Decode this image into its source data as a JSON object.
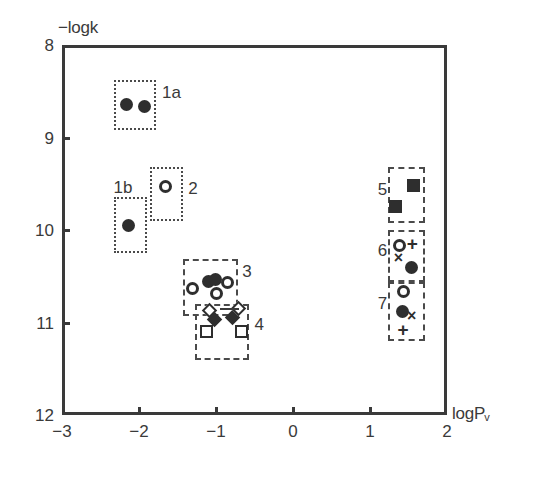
{
  "chart_data": {
    "type": "scatter",
    "title": "",
    "xlabel": "logPv",
    "ylabel": "-logk",
    "xlim": [
      -3,
      2
    ],
    "ylim": [
      12,
      8
    ],
    "y_axis_inverted": true,
    "grid": false,
    "legend": "none",
    "xticks": [
      -3,
      -2,
      -1,
      0,
      1,
      2
    ],
    "xtick_labels": [
      "-3",
      "-2",
      "-1",
      "0",
      "1",
      "2"
    ],
    "yticks": [
      8,
      9,
      10,
      11,
      12
    ],
    "ytick_labels": [
      "8",
      "9",
      "10",
      "11",
      "12"
    ],
    "groups": [
      {
        "name": "1a",
        "label": "1a",
        "box": {
          "x": [
            -2.32,
            -1.78
          ],
          "y": [
            8.38,
            8.92
          ],
          "style": "dotted"
        },
        "label_pos": {
          "x": -1.7,
          "y": 8.52
        },
        "points": [
          {
            "x": -2.16,
            "y": 8.64,
            "marker": "filled-circle"
          },
          {
            "x": -1.93,
            "y": 8.66,
            "marker": "filled-circle"
          }
        ]
      },
      {
        "name": "1b",
        "label": "1b",
        "box": {
          "x": [
            -2.33,
            -1.9
          ],
          "y": [
            9.64,
            10.25
          ],
          "style": "dotted"
        },
        "label_pos": {
          "x": -2.33,
          "y": 9.55
        },
        "points": [
          {
            "x": -2.13,
            "y": 9.95,
            "marker": "filled-circle"
          }
        ]
      },
      {
        "name": "2",
        "label": "2",
        "box": {
          "x": [
            -1.86,
            -1.43
          ],
          "y": [
            9.32,
            9.9
          ],
          "style": "dotted"
        },
        "label_pos": {
          "x": -1.36,
          "y": 9.56
        },
        "points": [
          {
            "x": -1.66,
            "y": 9.53,
            "marker": "open-circle"
          }
        ]
      },
      {
        "name": "3",
        "label": "3",
        "box": {
          "x": [
            -1.43,
            -0.72
          ],
          "y": [
            10.31,
            10.93
          ],
          "style": "dashed"
        },
        "label_pos": {
          "x": -0.66,
          "y": 10.45
        },
        "points": [
          {
            "x": -1.3,
            "y": 10.63,
            "marker": "open-circle"
          },
          {
            "x": -1.1,
            "y": 10.56,
            "marker": "filled-circle"
          },
          {
            "x": -1.01,
            "y": 10.54,
            "marker": "filled-circle"
          },
          {
            "x": -0.99,
            "y": 10.69,
            "marker": "open-circle"
          },
          {
            "x": -0.85,
            "y": 10.57,
            "marker": "open-circle"
          }
        ]
      },
      {
        "name": "4",
        "label": "4",
        "box": {
          "x": [
            -1.27,
            -0.57
          ],
          "y": [
            10.8,
            11.4
          ],
          "style": "dashed"
        },
        "label_pos": {
          "x": -0.5,
          "y": 11.03
        },
        "points": [
          {
            "x": -1.08,
            "y": 10.87,
            "marker": "open-diamond"
          },
          {
            "x": -1.02,
            "y": 10.97,
            "marker": "filled-diamond"
          },
          {
            "x": -0.79,
            "y": 10.95,
            "marker": "filled-diamond"
          },
          {
            "x": -0.71,
            "y": 10.85,
            "marker": "open-diamond"
          },
          {
            "x": -1.12,
            "y": 11.1,
            "marker": "open-square"
          },
          {
            "x": -0.67,
            "y": 11.1,
            "marker": "open-square"
          }
        ]
      },
      {
        "name": "5",
        "label": "5",
        "box": {
          "x": [
            1.24,
            1.72
          ],
          "y": [
            9.32,
            9.92
          ],
          "style": "dashed"
        },
        "label_pos": {
          "x": 1.1,
          "y": 9.57
        },
        "points": [
          {
            "x": 1.57,
            "y": 9.52,
            "marker": "filled-square"
          },
          {
            "x": 1.33,
            "y": 9.75,
            "marker": "filled-square"
          }
        ]
      },
      {
        "name": "6",
        "label": "6",
        "box": {
          "x": [
            1.24,
            1.72
          ],
          "y": [
            10.0,
            10.56
          ],
          "style": "dashed"
        },
        "label_pos": {
          "x": 1.1,
          "y": 10.23
        },
        "points": [
          {
            "x": 1.38,
            "y": 10.17,
            "marker": "open-circle"
          },
          {
            "x": 1.55,
            "y": 10.15,
            "marker": "plus"
          },
          {
            "x": 1.37,
            "y": 10.31,
            "marker": "cross"
          },
          {
            "x": 1.54,
            "y": 10.4,
            "marker": "filled-circle"
          }
        ]
      },
      {
        "name": "7",
        "label": "7",
        "box": {
          "x": [
            1.24,
            1.72
          ],
          "y": [
            10.56,
            11.2
          ],
          "style": "dashed"
        },
        "label_pos": {
          "x": 1.1,
          "y": 10.8
        },
        "points": [
          {
            "x": 1.43,
            "y": 10.67,
            "marker": "open-circle"
          },
          {
            "x": 1.42,
            "y": 10.88,
            "marker": "filled-circle"
          },
          {
            "x": 1.54,
            "y": 10.93,
            "marker": "cross"
          },
          {
            "x": 1.43,
            "y": 11.08,
            "marker": "plus"
          }
        ]
      }
    ],
    "connector": {
      "x": [
        -0.95,
        -0.7
      ],
      "y": 10.84
    }
  }
}
